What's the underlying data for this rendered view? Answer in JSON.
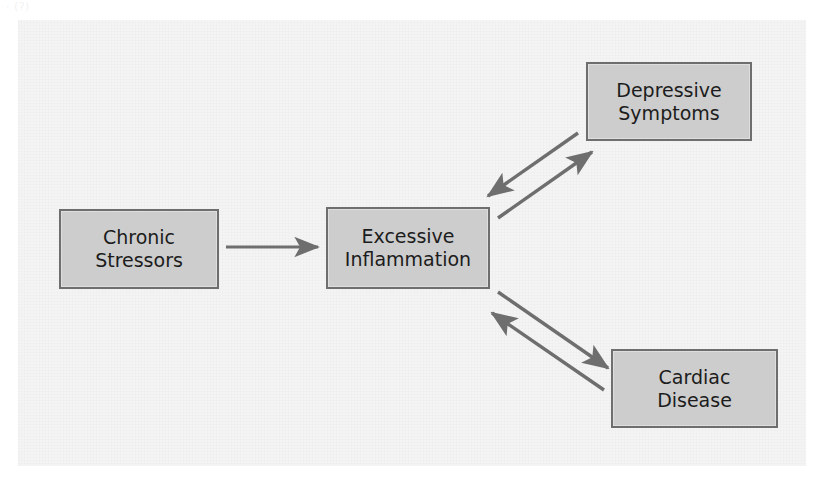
{
  "figure": {
    "caption_fragment": "· (?)",
    "panel_color": "#f4f4f4",
    "node_fill_color": "#cdcdcd",
    "node_border_color": "#6e6e6e",
    "arrow_color": "#6e6e6e",
    "text_color": "#1c1c1c"
  },
  "nodes": [
    {
      "id": "chronic-stressors",
      "label": "Chronic\nStressors",
      "x": 59,
      "y": 209,
      "width": 160,
      "height": 80
    },
    {
      "id": "excessive-inflammation",
      "label": "Excessive\nInflammation",
      "x": 326,
      "y": 207,
      "width": 164,
      "height": 82
    },
    {
      "id": "depressive-symptoms",
      "label": "Depressive\nSymptoms",
      "x": 586,
      "y": 62,
      "width": 166,
      "height": 79
    },
    {
      "id": "cardiac-disease",
      "label": "Cardiac\nDisease",
      "x": 611,
      "y": 349,
      "width": 167,
      "height": 79
    }
  ],
  "edges": [
    {
      "id": "stressors-to-inflammation",
      "from": "chronic-stressors",
      "to": "excessive-inflammation",
      "direction": "one-way",
      "label": ""
    },
    {
      "id": "inflammation-to-depression",
      "from": "excessive-inflammation",
      "to": "depressive-symptoms",
      "direction": "bidirectional",
      "label": ""
    },
    {
      "id": "inflammation-to-cardiac",
      "from": "excessive-inflammation",
      "to": "cardiac-disease",
      "direction": "bidirectional",
      "label": ""
    }
  ]
}
